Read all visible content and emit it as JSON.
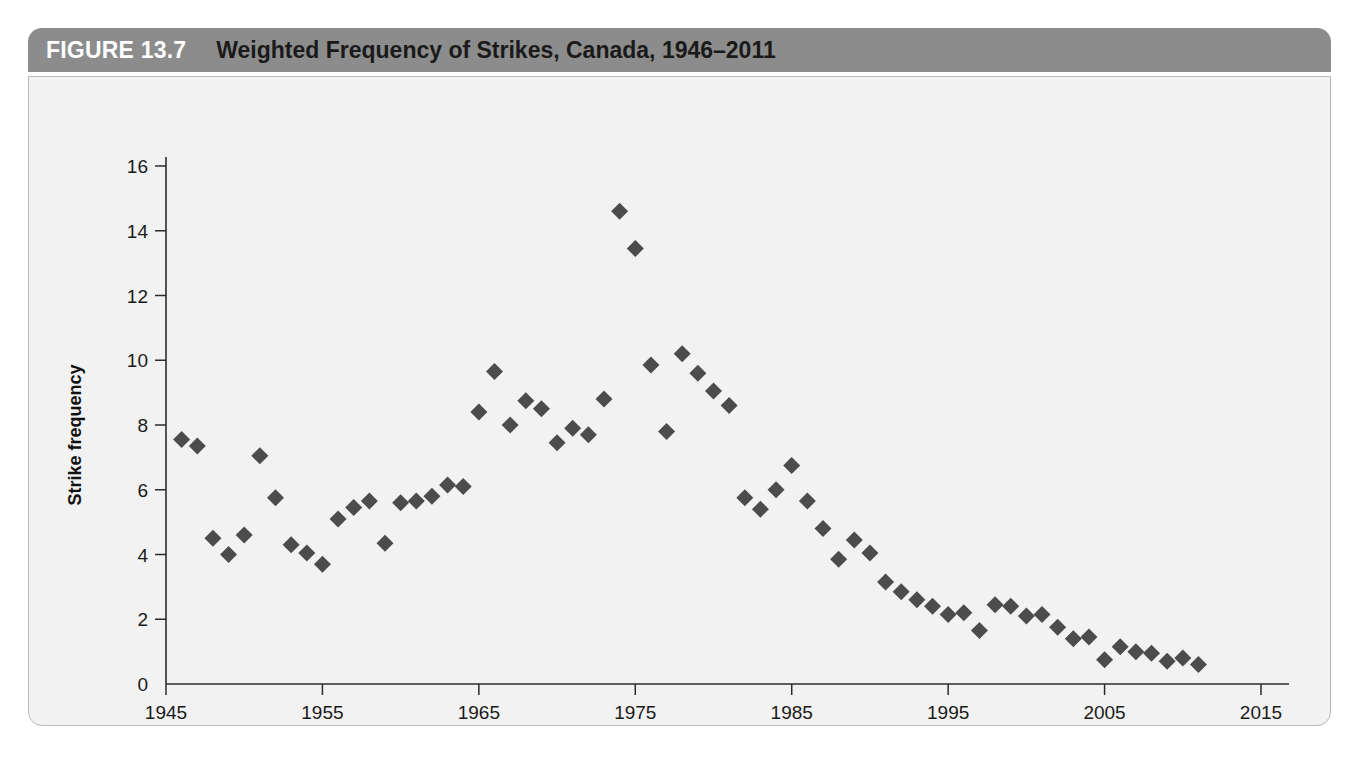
{
  "figure": {
    "number_label": "FIGURE 13.7",
    "title": "Weighted Frequency of Strikes, Canada, 1946–2011",
    "header_bg": "#8c8c8c",
    "panel_bg": "#f2f2f2",
    "marker_color": "#4c4c4c"
  },
  "chart_data": {
    "type": "scatter",
    "title": "Weighted Frequency of Strikes, Canada, 1946–2011",
    "xlabel": "",
    "ylabel": "Strike frequency",
    "xlim": [
      1945,
      2015
    ],
    "ylim": [
      0,
      16
    ],
    "xticks": [
      1945,
      1955,
      1965,
      1975,
      1985,
      1995,
      2005,
      2015
    ],
    "xtick_labels": [
      "1945",
      "1955",
      "1965",
      "1975",
      "1985",
      "1995",
      "2005",
      "2015"
    ],
    "yticks": [
      0,
      2,
      4,
      6,
      8,
      10,
      12,
      14,
      16
    ],
    "ytick_labels": [
      "0",
      "2",
      "4",
      "6",
      "8",
      "10",
      "12",
      "14",
      "16"
    ],
    "grid": false,
    "legend": null,
    "marker": "diamond",
    "series": [
      {
        "name": "Strike frequency",
        "x": [
          1946,
          1947,
          1948,
          1949,
          1950,
          1951,
          1952,
          1953,
          1954,
          1955,
          1956,
          1957,
          1958,
          1959,
          1960,
          1961,
          1962,
          1963,
          1964,
          1965,
          1966,
          1967,
          1968,
          1969,
          1970,
          1971,
          1972,
          1973,
          1974,
          1975,
          1976,
          1977,
          1978,
          1979,
          1980,
          1981,
          1982,
          1983,
          1984,
          1985,
          1986,
          1987,
          1988,
          1989,
          1990,
          1991,
          1992,
          1993,
          1994,
          1995,
          1996,
          1997,
          1998,
          1999,
          2000,
          2001,
          2002,
          2003,
          2004,
          2005,
          2006,
          2007,
          2008,
          2009,
          2010,
          2011
        ],
        "y": [
          7.55,
          7.35,
          4.5,
          4.0,
          4.6,
          7.05,
          5.75,
          4.3,
          4.05,
          3.7,
          5.1,
          5.45,
          5.65,
          4.35,
          5.6,
          5.65,
          5.8,
          6.15,
          6.1,
          8.4,
          9.65,
          8.0,
          8.75,
          8.5,
          7.45,
          7.9,
          7.7,
          8.8,
          14.6,
          13.45,
          9.85,
          7.8,
          10.2,
          9.6,
          9.05,
          8.6,
          5.75,
          5.4,
          6.0,
          6.75,
          5.65,
          4.8,
          3.85,
          4.45,
          4.05,
          3.15,
          2.85,
          2.6,
          2.4,
          2.15,
          2.2,
          1.65,
          2.45,
          2.4,
          2.1,
          2.15,
          1.75,
          1.4,
          1.45,
          0.75,
          1.15,
          1.0,
          0.95,
          0.7,
          0.8,
          0.6
        ]
      }
    ]
  }
}
